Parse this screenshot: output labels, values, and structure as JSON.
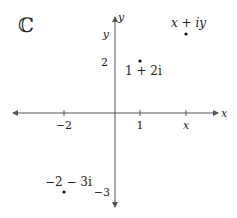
{
  "title": "ℂ",
  "axes": {
    "x_label": "x",
    "y_label": "y",
    "color": "#555555",
    "origin_px": [
      115,
      113
    ],
    "unit_px": 25.5
  },
  "ticks": {
    "x": [
      {
        "value": -2,
        "label": "−2"
      },
      {
        "value": 1,
        "label": "1"
      },
      {
        "value": 2.8,
        "label": "x"
      }
    ],
    "y": [
      {
        "value": 2,
        "label": "2"
      },
      {
        "value": 3.1,
        "label": "y"
      },
      {
        "value": -3,
        "label": "−3"
      }
    ]
  },
  "points": [
    {
      "re": 1,
      "im": 2,
      "label": "1 + 2i"
    },
    {
      "re": 2.8,
      "im": 3.1,
      "label": "x + iy"
    },
    {
      "re": -2,
      "im": -3,
      "label": "−2 − 3i"
    }
  ]
}
